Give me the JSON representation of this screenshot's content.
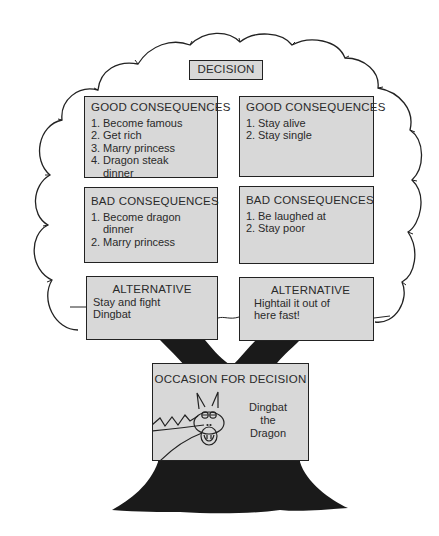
{
  "decision": {
    "label": "DECISION"
  },
  "options": [
    {
      "good": {
        "title": "GOOD CONSEQUENCES",
        "items": [
          "Become famous",
          "Get rich",
          "Marry princess",
          "Dragon steak dinner"
        ]
      },
      "bad": {
        "title": "BAD CONSEQUENCES",
        "items": [
          "Become dragon dinner",
          "Marry princess"
        ]
      },
      "alternative": {
        "title": "ALTERNATIVE",
        "text": "Stay and fight Dingbat"
      }
    },
    {
      "good": {
        "title": "GOOD CONSEQUENCES",
        "items": [
          "Stay alive",
          "Stay single"
        ]
      },
      "bad": {
        "title": "BAD CONSEQUENCES",
        "items": [
          "Be laughed at",
          "Stay poor"
        ]
      },
      "alternative": {
        "title": "ALTERNATIVE",
        "text": "Hightail it out of here fast!"
      }
    }
  ],
  "occasion": {
    "title": "OCCASION FOR DECISION",
    "caption_lines": [
      "Dingbat",
      "the",
      "Dragon"
    ],
    "icon": "dragon-head-icon"
  },
  "colors": {
    "box_fill": "#d8d8d8",
    "outline": "#222222",
    "trunk": "#1a1a1a"
  }
}
